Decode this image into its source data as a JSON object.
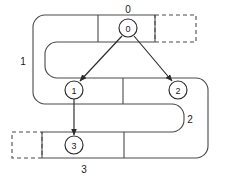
{
  "diagram": {
    "background_color": "#ffffff",
    "line_color": "#4a4a4a",
    "edge_color": "#2a2a2a",
    "text_color": "#1a1a1a",
    "nodes": [
      {
        "id": "node-0",
        "label": "0",
        "cx": 128,
        "cy": 28,
        "r": 9
      },
      {
        "id": "node-1",
        "label": "1",
        "cx": 74,
        "cy": 90,
        "r": 9
      },
      {
        "id": "node-2",
        "label": "2",
        "cx": 178,
        "cy": 90,
        "r": 9
      },
      {
        "id": "node-3",
        "label": "3",
        "cx": 74,
        "cy": 145,
        "r": 9
      }
    ],
    "level_labels": [
      {
        "id": "level-label-0",
        "label": "0",
        "x": 128,
        "y": 11
      },
      {
        "id": "level-label-1",
        "label": "1",
        "x": 23,
        "y": 62
      },
      {
        "id": "level-label-2",
        "label": "2",
        "x": 190,
        "y": 120
      },
      {
        "id": "level-label-3",
        "label": "3",
        "x": 84,
        "y": 172
      }
    ],
    "edges": [
      {
        "id": "edge-0-to-1",
        "from": "0",
        "to": "1"
      },
      {
        "id": "edge-0-to-2",
        "from": "0",
        "to": "2"
      },
      {
        "id": "edge-1-to-3",
        "from": "1",
        "to": "3"
      }
    ],
    "rows": [
      {
        "id": "row-0",
        "label": "0",
        "top": 15,
        "bottom": 42,
        "dashed_cell": true
      },
      {
        "id": "row-1",
        "label": "1",
        "top": 44,
        "bottom": 71,
        "dashed_cell": false
      },
      {
        "id": "row-2",
        "label": "2",
        "top": 78,
        "bottom": 104,
        "dashed_cell": false
      },
      {
        "id": "row-3",
        "label": "3",
        "top": 132,
        "bottom": 158,
        "dashed_cell": true
      }
    ]
  }
}
